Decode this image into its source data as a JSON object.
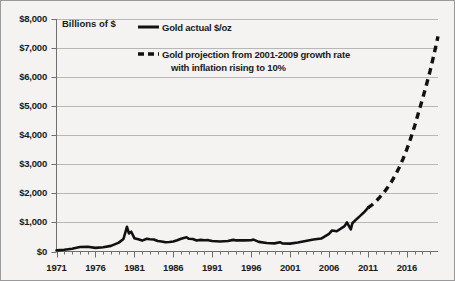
{
  "chart_data": {
    "type": "line",
    "title": "",
    "ylabel": "Billions of $",
    "xlabel": "",
    "ylim": [
      0,
      8000
    ],
    "xlim": [
      1971,
      2020
    ],
    "grid": true,
    "legend_position": "top-left-inside",
    "ytick_labels": [
      "$0",
      "$1,000",
      "$2,000",
      "$3,000",
      "$4,000",
      "$5,000",
      "$6,000",
      "$7,000",
      "$8,000"
    ],
    "ytick_values": [
      0,
      1000,
      2000,
      3000,
      4000,
      5000,
      6000,
      7000,
      8000
    ],
    "xtick_labels": [
      "1971",
      "1976",
      "1981",
      "1986",
      "1991",
      "1996",
      "2001",
      "2006",
      "2011",
      "2016"
    ],
    "xtick_values": [
      1971,
      1976,
      1981,
      1986,
      1991,
      1996,
      2001,
      2006,
      2011,
      2016
    ],
    "series": [
      {
        "name": "Gold actual $/oz",
        "style": "solid",
        "color": "#111111",
        "x": [
          1971,
          1972,
          1973,
          1974,
          1975,
          1976,
          1977,
          1978,
          1979,
          1979.6,
          1980.05,
          1980.3,
          1980.6,
          1981,
          1981.5,
          1982,
          1982.6,
          1983,
          1983.5,
          1984,
          1984.5,
          1985,
          1985.5,
          1986,
          1986.5,
          1987,
          1987.7,
          1988,
          1988.5,
          1989,
          1989.5,
          1990,
          1990.5,
          1991,
          1992,
          1993,
          1993.7,
          1994,
          1995,
          1996,
          1996.3,
          1997,
          1998,
          1999,
          1999.7,
          2000,
          2001,
          2002,
          2003,
          2004,
          2005,
          2006,
          2006.4,
          2007,
          2008,
          2008.3,
          2008.8,
          2009,
          2009.6,
          2010,
          2010.5,
          2011
        ],
        "values": [
          40,
          58,
          97,
          154,
          161,
          125,
          148,
          193,
          306,
          430,
          850,
          620,
          680,
          460,
          420,
          375,
          440,
          420,
          415,
          360,
          345,
          318,
          325,
          345,
          390,
          440,
          490,
          437,
          430,
          380,
          400,
          385,
          390,
          362,
          344,
          360,
          400,
          384,
          384,
          388,
          410,
          331,
          294,
          279,
          320,
          279,
          271,
          310,
          363,
          410,
          445,
          604,
          725,
          696,
          872,
          1000,
          760,
          973,
          1130,
          1225,
          1350,
          1500
        ]
      },
      {
        "name": "Gold projection from 2001-2009 growth rate with inflation rising to 10%",
        "style": "dashed",
        "color": "#111111",
        "x": [
          2011,
          2011.5,
          2012,
          2012.5,
          2013,
          2013.5,
          2014,
          2014.5,
          2015,
          2015.5,
          2016,
          2016.5,
          2017,
          2017.5,
          2018,
          2018.5,
          2019,
          2019.5,
          2020
        ],
        "values": [
          1500,
          1600,
          1720,
          1860,
          2010,
          2190,
          2390,
          2620,
          2880,
          3180,
          3520,
          3900,
          4320,
          4780,
          5240,
          5720,
          6230,
          6800,
          7400
        ]
      }
    ]
  },
  "legend": {
    "entries": [
      {
        "label": "Gold actual $/oz",
        "style": "solid"
      },
      {
        "label": "Gold projection from 2001-2009 growth rate",
        "style": "dashed"
      },
      {
        "label": "with inflation rising to 10%",
        "style": "none"
      }
    ]
  },
  "colors": {
    "line": "#111111",
    "grid": "#b7b7b7",
    "axis": "#6e6e6e",
    "background": "#f4f3f1",
    "text": "#1a1a1a"
  }
}
